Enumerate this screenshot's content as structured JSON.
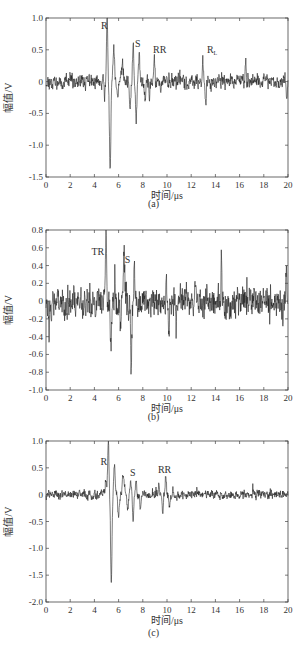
{
  "chart_data": [
    {
      "type": "line",
      "id": "a",
      "caption": "(a)",
      "xlabel": "时间/μs",
      "ylabel": "幅值/V",
      "xlim": [
        0,
        20
      ],
      "ylim": [
        -1.5,
        1.0
      ],
      "xticks": [
        0,
        2,
        4,
        6,
        8,
        10,
        12,
        14,
        16,
        18,
        20
      ],
      "yticks": [
        1.0,
        0.5,
        0,
        -0.5,
        -1.0,
        -1.5
      ],
      "ytick_labels": [
        "1.0",
        "0.5",
        "0",
        "-0.5",
        "-1.0",
        "-1.5"
      ],
      "frame": {
        "top": 18,
        "bottom": 177,
        "left": 46,
        "right": 288
      },
      "noise_amp": 0.13,
      "seed": 11,
      "events": [
        {
          "t": 4.85,
          "a": -0.28,
          "w": 0.05
        },
        {
          "t": 5.05,
          "a": 1.0,
          "w": 0.07
        },
        {
          "t": 5.3,
          "a": -1.42,
          "w": 0.08
        },
        {
          "t": 5.6,
          "a": 0.52,
          "w": 0.09
        },
        {
          "t": 5.9,
          "a": -0.22,
          "w": 0.1
        },
        {
          "t": 6.3,
          "a": 0.28,
          "w": 0.12
        },
        {
          "t": 6.95,
          "a": -0.5,
          "w": 0.07
        },
        {
          "t": 7.2,
          "a": 0.58,
          "w": 0.07
        },
        {
          "t": 7.45,
          "a": -0.6,
          "w": 0.07
        },
        {
          "t": 7.7,
          "a": 0.38,
          "w": 0.07
        },
        {
          "t": 8.2,
          "a": -0.2,
          "w": 0.08
        },
        {
          "t": 8.55,
          "a": -0.3,
          "w": 0.06
        },
        {
          "t": 8.95,
          "a": 0.38,
          "w": 0.06
        },
        {
          "t": 9.5,
          "a": -0.2,
          "w": 0.06
        },
        {
          "t": 12.95,
          "a": 0.4,
          "w": 0.06
        },
        {
          "t": 13.2,
          "a": -0.38,
          "w": 0.06
        },
        {
          "t": 16.5,
          "a": 0.35,
          "w": 0.05
        },
        {
          "t": 19.9,
          "a": -0.25,
          "w": 0.05
        }
      ],
      "annotations": [
        {
          "text": "R",
          "x": 4.55,
          "y": 0.82
        },
        {
          "text": "S",
          "x": 7.35,
          "y": 0.55
        },
        {
          "text": "RR",
          "x": 8.85,
          "y": 0.45
        },
        {
          "text": "R",
          "sub": "L",
          "x": 13.3,
          "y": 0.45
        }
      ]
    },
    {
      "type": "line",
      "id": "b",
      "caption": "(b)",
      "xlabel": "时间/μs",
      "ylabel": "幅值/V",
      "xlim": [
        0,
        20
      ],
      "ylim": [
        -1.0,
        0.8
      ],
      "xticks": [
        0,
        2,
        4,
        6,
        8,
        10,
        12,
        14,
        16,
        18,
        20
      ],
      "yticks": [
        0.8,
        0.6,
        0.4,
        0.2,
        0,
        -0.2,
        -0.4,
        -0.6,
        -0.8,
        -1.0
      ],
      "ytick_labels": [
        "0.8",
        "0.6",
        "0.4",
        "0.2",
        "0",
        "-0.2",
        "-0.4",
        "-0.6",
        "-0.8",
        "-1.0"
      ],
      "frame": {
        "top": 230,
        "bottom": 390,
        "left": 46,
        "right": 288
      },
      "noise_amp": 0.2,
      "seed": 23,
      "events": [
        {
          "t": 0.25,
          "a": -0.4,
          "w": 0.04
        },
        {
          "t": 0.45,
          "a": -0.15,
          "w": 0.05
        },
        {
          "t": 4.1,
          "a": -0.22,
          "w": 0.05
        },
        {
          "t": 4.95,
          "a": 0.8,
          "w": 0.07
        },
        {
          "t": 5.35,
          "a": -0.5,
          "w": 0.07
        },
        {
          "t": 5.9,
          "a": -0.2,
          "w": 0.08
        },
        {
          "t": 6.15,
          "a": -0.32,
          "w": 0.06
        },
        {
          "t": 6.45,
          "a": 0.52,
          "w": 0.08
        },
        {
          "t": 6.8,
          "a": -0.3,
          "w": 0.06
        },
        {
          "t": 7.05,
          "a": -0.77,
          "w": 0.06
        },
        {
          "t": 7.3,
          "a": 0.44,
          "w": 0.06
        },
        {
          "t": 7.6,
          "a": -0.2,
          "w": 0.06
        },
        {
          "t": 9.95,
          "a": 0.36,
          "w": 0.05
        },
        {
          "t": 10.15,
          "a": -0.3,
          "w": 0.05
        },
        {
          "t": 10.75,
          "a": -0.3,
          "w": 0.05
        },
        {
          "t": 14.5,
          "a": 0.52,
          "w": 0.04
        },
        {
          "t": 19.6,
          "a": -0.22,
          "w": 0.05
        },
        {
          "t": 19.85,
          "a": 0.38,
          "w": 0.05
        }
      ],
      "annotations": [
        {
          "text": "TR",
          "x": 3.75,
          "y": 0.52
        },
        {
          "text": "S",
          "x": 6.5,
          "y": 0.43
        }
      ]
    },
    {
      "type": "line",
      "id": "c",
      "caption": "(c)",
      "xlabel": "时间/μs",
      "ylabel": "幅值/V",
      "xlim": [
        0,
        20
      ],
      "ylim": [
        -2.0,
        1.0
      ],
      "xticks": [
        0,
        2,
        4,
        6,
        8,
        10,
        12,
        14,
        16,
        18,
        20
      ],
      "yticks": [
        1.0,
        0.5,
        0,
        -0.5,
        -1.0,
        -1.5,
        -2.0
      ],
      "ytick_labels": [
        "1.0",
        "0.5",
        "0",
        "-0.5",
        "-1.0",
        "-1.5",
        "-2.0"
      ],
      "frame": {
        "top": 441,
        "bottom": 602,
        "left": 46,
        "right": 288
      },
      "noise_amp": 0.1,
      "seed": 37,
      "events": [
        {
          "t": 4.95,
          "a": 0.25,
          "w": 0.08
        },
        {
          "t": 5.15,
          "a": 0.95,
          "w": 0.07
        },
        {
          "t": 5.4,
          "a": -1.62,
          "w": 0.08
        },
        {
          "t": 5.65,
          "a": 0.6,
          "w": 0.08
        },
        {
          "t": 6.0,
          "a": -0.4,
          "w": 0.1
        },
        {
          "t": 6.4,
          "a": 0.36,
          "w": 0.12
        },
        {
          "t": 6.75,
          "a": -0.28,
          "w": 0.08
        },
        {
          "t": 7.0,
          "a": 0.22,
          "w": 0.06
        },
        {
          "t": 7.2,
          "a": -0.48,
          "w": 0.07
        },
        {
          "t": 7.45,
          "a": 0.28,
          "w": 0.07
        },
        {
          "t": 7.8,
          "a": -0.2,
          "w": 0.07
        },
        {
          "t": 9.35,
          "a": 0.2,
          "w": 0.07
        },
        {
          "t": 9.65,
          "a": -0.38,
          "w": 0.07
        },
        {
          "t": 9.9,
          "a": 0.32,
          "w": 0.07
        },
        {
          "t": 10.2,
          "a": -0.22,
          "w": 0.07
        },
        {
          "t": 10.5,
          "a": 0.12,
          "w": 0.07
        }
      ],
      "annotations": [
        {
          "text": "R",
          "x": 4.5,
          "y": 0.55
        },
        {
          "text": "S",
          "x": 6.95,
          "y": 0.35
        },
        {
          "text": "RR",
          "x": 9.25,
          "y": 0.4
        }
      ]
    }
  ],
  "figure": {
    "line_color": "#222222",
    "axis_color": "#444444",
    "tick_font_px": 9,
    "label_font_px": 10
  }
}
